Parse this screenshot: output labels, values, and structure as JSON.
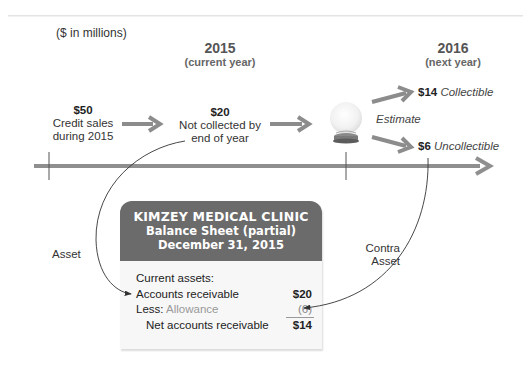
{
  "units_note": "($ in millions)",
  "years": [
    {
      "year": "2015",
      "caption": "(current year)"
    },
    {
      "year": "2016",
      "caption": "(next year)"
    }
  ],
  "flow": {
    "credit_sales": {
      "amount": "$50",
      "line1": "Credit sales",
      "line2": "during 2015"
    },
    "not_collected": {
      "amount": "$20",
      "line1": "Not collected by",
      "line2": "end of year"
    },
    "estimate_label": "Estimate",
    "collectible": {
      "amount": "$14",
      "label": "Collectible"
    },
    "uncollectible": {
      "amount": "$6",
      "label": "Uncollectible"
    }
  },
  "connectors": {
    "asset_label": "Asset",
    "contra_label_1": "Contra",
    "contra_label_2": "Asset"
  },
  "balance_sheet": {
    "company": "KIMZEY MEDICAL CLINIC",
    "title": "Balance Sheet (partial)",
    "date": "December 31, 2015",
    "section": "Current assets:",
    "rows": [
      {
        "label": "Accounts receivable",
        "value": "$20"
      },
      {
        "label_prefix": "Less:",
        "label": "Allowance",
        "value": "(6)"
      },
      {
        "label": "Net accounts receivable",
        "value": "$14"
      }
    ]
  },
  "colors": {
    "arrow_gray": "#8c8c8c",
    "header_gray": "#6b6b6b",
    "timeline_gray": "#8f8f8f",
    "allowance_text": "#999999"
  }
}
